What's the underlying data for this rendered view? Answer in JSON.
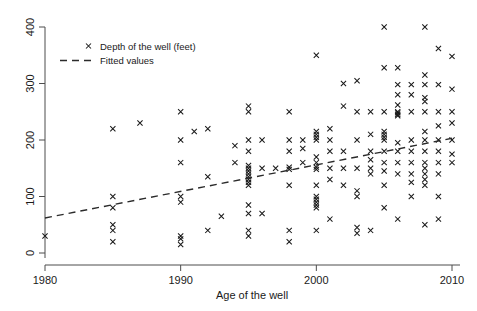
{
  "chart_data": {
    "type": "scatter",
    "title": "",
    "xlabel": "Age of the well",
    "ylabel": "",
    "xlim": [
      1980,
      2010
    ],
    "ylim": [
      0,
      400
    ],
    "xticks": [
      1980,
      1990,
      2000,
      2010
    ],
    "yticks": [
      0,
      100,
      200,
      300,
      400
    ],
    "xtick_labels": [
      "1980",
      "1990",
      "2000",
      "2010"
    ],
    "ytick_labels": [
      "0",
      "100",
      "200",
      "300",
      "400"
    ],
    "grid": false,
    "legend_position": "top-left",
    "series": [
      {
        "name": "Depth of the well (feet)",
        "marker": "x",
        "color": "#1a1a1a",
        "points": [
          [
            1980,
            30
          ],
          [
            1985,
            220
          ],
          [
            1985,
            100
          ],
          [
            1985,
            80
          ],
          [
            1985,
            50
          ],
          [
            1985,
            40
          ],
          [
            1985,
            20
          ],
          [
            1987,
            230
          ],
          [
            1990,
            250
          ],
          [
            1990,
            200
          ],
          [
            1990,
            160
          ],
          [
            1990,
            100
          ],
          [
            1990,
            90
          ],
          [
            1990,
            30
          ],
          [
            1990,
            25
          ],
          [
            1990,
            15
          ],
          [
            1991,
            215
          ],
          [
            1992,
            220
          ],
          [
            1992,
            135
          ],
          [
            1992,
            40
          ],
          [
            1993,
            65
          ],
          [
            1994,
            190
          ],
          [
            1994,
            160
          ],
          [
            1995,
            260
          ],
          [
            1995,
            250
          ],
          [
            1995,
            200
          ],
          [
            1995,
            180
          ],
          [
            1995,
            155
          ],
          [
            1995,
            150
          ],
          [
            1995,
            145
          ],
          [
            1995,
            140
          ],
          [
            1995,
            135
          ],
          [
            1995,
            130
          ],
          [
            1995,
            125
          ],
          [
            1995,
            120
          ],
          [
            1995,
            85
          ],
          [
            1995,
            70
          ],
          [
            1995,
            40
          ],
          [
            1995,
            30
          ],
          [
            1996,
            200
          ],
          [
            1996,
            150
          ],
          [
            1996,
            70
          ],
          [
            1997,
            150
          ],
          [
            1998,
            250
          ],
          [
            1998,
            200
          ],
          [
            1998,
            180
          ],
          [
            1998,
            152
          ],
          [
            1998,
            148
          ],
          [
            1998,
            120
          ],
          [
            1998,
            40
          ],
          [
            1998,
            20
          ],
          [
            1999,
            200
          ],
          [
            1999,
            185
          ],
          [
            1999,
            160
          ],
          [
            2000,
            350
          ],
          [
            2000,
            215
          ],
          [
            2000,
            210
          ],
          [
            2000,
            205
          ],
          [
            2000,
            200
          ],
          [
            2000,
            170
          ],
          [
            2000,
            160
          ],
          [
            2000,
            152
          ],
          [
            2000,
            148
          ],
          [
            2000,
            120
          ],
          [
            2000,
            100
          ],
          [
            2000,
            95
          ],
          [
            2000,
            90
          ],
          [
            2000,
            85
          ],
          [
            2000,
            80
          ],
          [
            2000,
            40
          ],
          [
            2001,
            220
          ],
          [
            2001,
            200
          ],
          [
            2001,
            180
          ],
          [
            2001,
            150
          ],
          [
            2001,
            130
          ],
          [
            2001,
            60
          ],
          [
            2002,
            300
          ],
          [
            2002,
            260
          ],
          [
            2002,
            180
          ],
          [
            2002,
            150
          ],
          [
            2002,
            120
          ],
          [
            2003,
            305
          ],
          [
            2003,
            250
          ],
          [
            2003,
            200
          ],
          [
            2003,
            150
          ],
          [
            2003,
            110
          ],
          [
            2003,
            100
          ],
          [
            2003,
            45
          ],
          [
            2003,
            35
          ],
          [
            2004,
            250
          ],
          [
            2004,
            210
          ],
          [
            2004,
            180
          ],
          [
            2004,
            165
          ],
          [
            2004,
            150
          ],
          [
            2004,
            140
          ],
          [
            2004,
            40
          ],
          [
            2005,
            400
          ],
          [
            2005,
            328
          ],
          [
            2005,
            250
          ],
          [
            2005,
            215
          ],
          [
            2005,
            210
          ],
          [
            2005,
            205
          ],
          [
            2005,
            200
          ],
          [
            2005,
            180
          ],
          [
            2005,
            160
          ],
          [
            2005,
            145
          ],
          [
            2005,
            120
          ],
          [
            2005,
            80
          ],
          [
            2006,
            328
          ],
          [
            2006,
            298
          ],
          [
            2006,
            280
          ],
          [
            2006,
            262
          ],
          [
            2006,
            250
          ],
          [
            2006,
            248
          ],
          [
            2006,
            245
          ],
          [
            2006,
            243
          ],
          [
            2006,
            195
          ],
          [
            2006,
            180
          ],
          [
            2006,
            160
          ],
          [
            2006,
            140
          ],
          [
            2006,
            60
          ],
          [
            2007,
            298
          ],
          [
            2007,
            280
          ],
          [
            2007,
            250
          ],
          [
            2007,
            200
          ],
          [
            2007,
            180
          ],
          [
            2007,
            160
          ],
          [
            2007,
            140
          ],
          [
            2007,
            125
          ],
          [
            2007,
            100
          ],
          [
            2008,
            400
          ],
          [
            2008,
            315
          ],
          [
            2008,
            298
          ],
          [
            2008,
            275
          ],
          [
            2008,
            268
          ],
          [
            2008,
            250
          ],
          [
            2008,
            215
          ],
          [
            2008,
            200
          ],
          [
            2008,
            180
          ],
          [
            2008,
            160
          ],
          [
            2008,
            150
          ],
          [
            2008,
            140
          ],
          [
            2008,
            130
          ],
          [
            2008,
            120
          ],
          [
            2008,
            50
          ],
          [
            2009,
            362
          ],
          [
            2009,
            298
          ],
          [
            2009,
            250
          ],
          [
            2009,
            225
          ],
          [
            2009,
            200
          ],
          [
            2009,
            180
          ],
          [
            2009,
            160
          ],
          [
            2009,
            140
          ],
          [
            2009,
            100
          ],
          [
            2009,
            60
          ],
          [
            2010,
            348
          ],
          [
            2010,
            290
          ],
          [
            2010,
            250
          ],
          [
            2010,
            230
          ],
          [
            2010,
            200
          ],
          [
            2010,
            175
          ],
          [
            2010,
            160
          ]
        ]
      }
    ],
    "fit_line": {
      "name": "Fitted values",
      "color": "#2b2b2b",
      "style": "dashed",
      "x": [
        1980,
        2010
      ],
      "y": [
        62,
        203
      ]
    },
    "legend": [
      {
        "label": "Depth of the well (feet)",
        "marker": "x"
      },
      {
        "label": "Fitted values",
        "marker": "dashed-line"
      }
    ]
  }
}
